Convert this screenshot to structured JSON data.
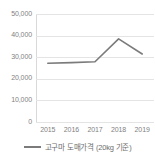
{
  "chart_data": {
    "type": "line",
    "title": "",
    "subtitle": "",
    "xlabel": "",
    "ylabel": "",
    "categories": [
      "2015",
      "2016",
      "2017",
      "2018",
      "2019"
    ],
    "series": [
      {
        "name": "고구마 도매가격 (20kg 기준)",
        "values": [
          27200,
          27500,
          27900,
          38500,
          31500
        ],
        "color": "#7b7b7b"
      }
    ],
    "ylim": [
      0,
      50000
    ],
    "y_ticks": [
      50000,
      40000,
      30000,
      20000,
      10000,
      0
    ],
    "y_tick_labels": [
      "50,000",
      "40,000",
      "30,000",
      "20,000",
      "10,000",
      "0"
    ],
    "grid": true,
    "grid_color": "#e4e4e4",
    "legend_position": "bottom",
    "legend": [
      {
        "label": "고구마 도매가격 (20kg 기준)",
        "marker": "line-swatch",
        "color": "#7b7b7b"
      }
    ]
  },
  "axes": {
    "y_axis_name": "y-axis",
    "x_axis_name": "x-axis"
  }
}
